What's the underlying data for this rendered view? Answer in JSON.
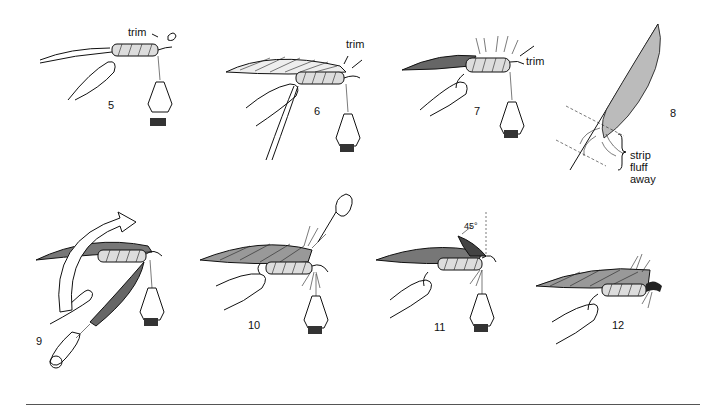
{
  "figure": {
    "steps": [
      {
        "number": "5",
        "annotation": "trim"
      },
      {
        "number": "6",
        "annotation": "trim"
      },
      {
        "number": "7",
        "annotation": "trim"
      },
      {
        "number": "8",
        "annotation": "strip fluff away",
        "annotation_lines": [
          "strip",
          "fluff",
          "away"
        ]
      },
      {
        "number": "9",
        "annotation": ""
      },
      {
        "number": "10",
        "annotation": ""
      },
      {
        "number": "11",
        "annotation": "45°"
      },
      {
        "number": "12",
        "annotation": ""
      }
    ]
  }
}
